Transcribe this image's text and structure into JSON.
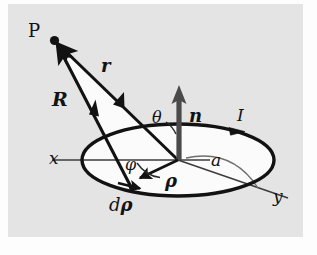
{
  "figure": {
    "background_color": "#e4e4e4",
    "page_color": "#fdfdfd",
    "ink_color": "#121212",
    "labels": {
      "point_p": "P",
      "vector_r_small": "r",
      "vector_r_big": "R",
      "normal_n": "n",
      "angle_theta": "θ",
      "angle_phi": "φ",
      "rho": "ρ",
      "d_rho_d": "d",
      "d_rho_rho": "ρ",
      "radius_a": "a",
      "current_i": "I",
      "axis_x": "x",
      "axis_y": "y"
    },
    "geometry": {
      "origin": [
        178,
        160
      ],
      "point_p": [
        54,
        40
      ],
      "loop_center": [
        178,
        160
      ],
      "loop_semi_major": 96,
      "loop_semi_minor": 36,
      "source_point_drho": [
        131,
        187
      ],
      "normal_tip": [
        180,
        88
      ],
      "x_axis_end": [
        52,
        160
      ],
      "y_axis_end": [
        288,
        198
      ],
      "rho_tail": [
        178,
        160
      ],
      "rho_tip": [
        138,
        179
      ]
    }
  }
}
